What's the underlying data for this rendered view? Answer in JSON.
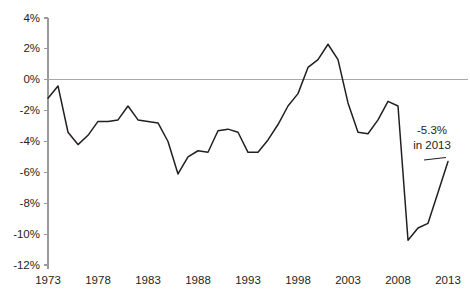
{
  "chart_data": {
    "type": "line",
    "title": "",
    "subtitle": "",
    "xlabel": "",
    "ylabel": "",
    "xlim": [
      1973,
      2013
    ],
    "ylim": [
      -12,
      4
    ],
    "grid": false,
    "legend": null,
    "zero_reference_line": true,
    "y_ticks": [
      "4%",
      "2%",
      "0%",
      "-2%",
      "-4%",
      "-6%",
      "-8%",
      "-10%",
      "-12%"
    ],
    "y_tick_values": [
      4,
      2,
      0,
      -2,
      -4,
      -6,
      -8,
      -10,
      -12
    ],
    "x_ticks": [
      "1973",
      "1978",
      "1983",
      "1988",
      "1993",
      "1998",
      "2003",
      "2008",
      "2013"
    ],
    "x_tick_values": [
      1973,
      1978,
      1983,
      1988,
      1993,
      1998,
      2003,
      2008,
      2013
    ],
    "series": [
      {
        "name": "value",
        "color": "#231f20",
        "x": [
          1973,
          1974,
          1975,
          1976,
          1977,
          1978,
          1979,
          1980,
          1981,
          1982,
          1983,
          1984,
          1985,
          1986,
          1987,
          1988,
          1989,
          1990,
          1991,
          1992,
          1993,
          1994,
          1995,
          1996,
          1997,
          1998,
          1999,
          2000,
          2001,
          2002,
          2003,
          2004,
          2005,
          2006,
          2007,
          2008,
          2009,
          2010,
          2011,
          2012,
          2013
        ],
        "values": [
          -1.2,
          -0.4,
          -3.4,
          -4.2,
          -3.6,
          -2.7,
          -2.7,
          -2.6,
          -1.7,
          -2.6,
          -2.7,
          -2.8,
          -4.0,
          -6.1,
          -5.0,
          -4.6,
          -4.7,
          -3.3,
          -3.2,
          -3.4,
          -4.7,
          -4.7,
          -3.9,
          -2.9,
          -1.7,
          -0.9,
          0.8,
          1.3,
          2.3,
          1.3,
          -1.5,
          -3.4,
          -3.5,
          -2.6,
          -1.4,
          -1.7,
          -10.4,
          -9.6,
          -9.3,
          -7.3,
          -5.3
        ]
      }
    ],
    "annotations": [
      {
        "name": "endpoint-callout",
        "line1": "-5.3%",
        "line2": "in 2013",
        "target_x": 2013,
        "target_y": -5.3
      }
    ]
  }
}
